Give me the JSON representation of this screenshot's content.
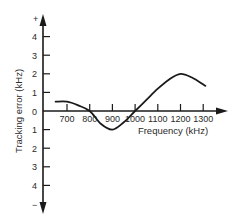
{
  "chart_data": {
    "type": "line",
    "title": "",
    "xlabel": "Frequency (kHz)",
    "ylabel": "Tracking error (kHz)",
    "x_ticks": [
      "700",
      "800",
      "900",
      "1000",
      "1100",
      "1200",
      "1300"
    ],
    "y_ticks_positive": [
      "1",
      "2",
      "3",
      "4"
    ],
    "y_ticks_negative": [
      "1",
      "2",
      "3",
      "4"
    ],
    "y_zero_label": "0",
    "y_top_sign": "+",
    "y_bottom_sign": "−",
    "xlim": [
      600,
      1400
    ],
    "ylim": [
      -5,
      5
    ],
    "grid": false,
    "legend": null,
    "series": [
      {
        "name": "Tracking error",
        "x": [
          650,
          700,
          750,
          800,
          850,
          900,
          950,
          1000,
          1050,
          1100,
          1150,
          1200,
          1250,
          1310
        ],
        "y": [
          0.5,
          0.5,
          0.3,
          0.0,
          -0.7,
          -1.0,
          -0.6,
          0.0,
          0.6,
          1.2,
          1.7,
          2.0,
          1.8,
          1.35
        ]
      }
    ]
  }
}
